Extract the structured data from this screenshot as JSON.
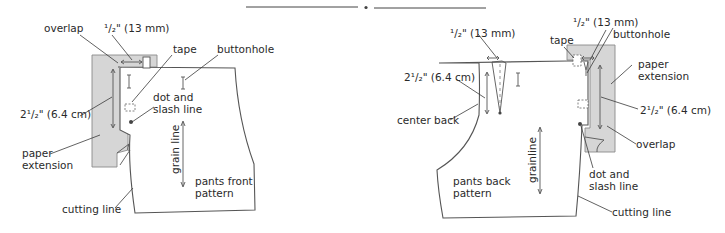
{
  "front": {
    "labels": {
      "overlap": "overlap",
      "half_inch": "¹/₂\" (13 mm)",
      "tape": "tape",
      "buttonhole": "buttonhole",
      "two_half": "2¹/₂\" (6.4 cm)",
      "dot_slash_1": "dot and",
      "dot_slash_2": "slash line",
      "paper_ext_1": "paper",
      "paper_ext_2": "extension",
      "grain": "grain line",
      "pattern_1": "pants front",
      "pattern_2": "pattern",
      "cutting": "cutting line"
    }
  },
  "back": {
    "labels": {
      "half_inch_dart": "¹/₂\" (13 mm)",
      "half_inch_ext": "¹/₂\" (13 mm)",
      "tape": "tape",
      "buttonhole": "buttonhole",
      "two_half_dart": "2¹/₂\" (6.4 cm)",
      "two_half_ext": "2¹/₂\" (6.4 cm)",
      "paper_ext_1": "paper",
      "paper_ext_2": "extension",
      "center_back": "center back",
      "overlap": "overlap",
      "grain": "grainline",
      "pattern_1": "pants back",
      "pattern_2": "pattern",
      "dot_slash_1": "dot and",
      "dot_slash_2": "slash line",
      "cutting": "cutting line"
    }
  },
  "colors": {
    "extension_fill": "#d6d6d6",
    "line": "#555555",
    "text": "#2a2a2a"
  }
}
